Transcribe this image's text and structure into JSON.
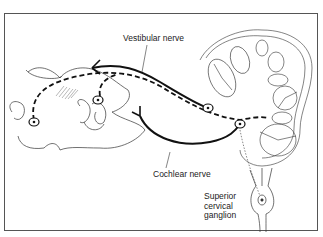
{
  "diagram": {
    "labels": {
      "vestibular_nerve": "Vestibular nerve",
      "cochlear_nerve": "Cochlear nerve",
      "superior_cervical_ganglion": "Superior cervical ganglion"
    },
    "line_styles": {
      "solid": "efferent nerve fibres",
      "dashed": "sympathetic/efferent pathway"
    },
    "colors": {
      "line": "#111111",
      "background": "#ffffff",
      "frame": "#555555"
    }
  }
}
